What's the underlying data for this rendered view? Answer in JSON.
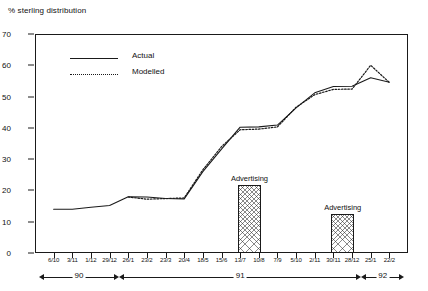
{
  "chart_data": {
    "type": "line",
    "title": "",
    "ylabel": "% sterling distribution",
    "xlabel": "",
    "ylim": [
      0,
      70
    ],
    "grid": false,
    "legend_position": "top-left",
    "y_ticks": [
      0,
      10,
      20,
      30,
      40,
      50,
      60,
      70
    ],
    "categories": [
      "6/10",
      "3/11",
      "1/12",
      "29/12",
      "26/1",
      "23/2",
      "23/3",
      "20/4",
      "18/5",
      "15/6",
      "13/7",
      "10/8",
      "7/9",
      "5/10",
      "2/11",
      "30/11",
      "28/12",
      "25/1",
      "22/2"
    ],
    "series": [
      {
        "name": "Actual",
        "style": "solid",
        "values": [
          14.0,
          14.0,
          14.6,
          15.2,
          18.0,
          17.9,
          17.4,
          17.3,
          26.0,
          33.2,
          40.2,
          40.3,
          40.9,
          46.4,
          51.2,
          53.2,
          53.3,
          56.0,
          54.6
        ]
      },
      {
        "name": "Modelled",
        "style": "dotted",
        "values": [
          null,
          null,
          null,
          null,
          17.9,
          17.2,
          17.4,
          17.6,
          26.6,
          34.0,
          39.4,
          39.6,
          40.3,
          46.6,
          50.6,
          52.3,
          52.4,
          60.0,
          54.5
        ]
      }
    ],
    "bars": [
      {
        "label": "Advertising",
        "start_category": "13/7",
        "end_category": "10/8",
        "value": 21.8
      },
      {
        "label": "Advertising",
        "start_category": "30/11",
        "end_category": "28/12",
        "value": 12.5
      }
    ],
    "year_brackets": [
      {
        "label": "90",
        "start_category": "6/10",
        "end_category": "29/12"
      },
      {
        "label": "91",
        "start_category": "26/1",
        "end_category": "28/12"
      },
      {
        "label": "92",
        "start_category": "25/1",
        "end_category": "22/2"
      }
    ]
  },
  "colors": {
    "ink": "#1a1a1a",
    "background": "#ffffff",
    "hatch": "#888888"
  }
}
